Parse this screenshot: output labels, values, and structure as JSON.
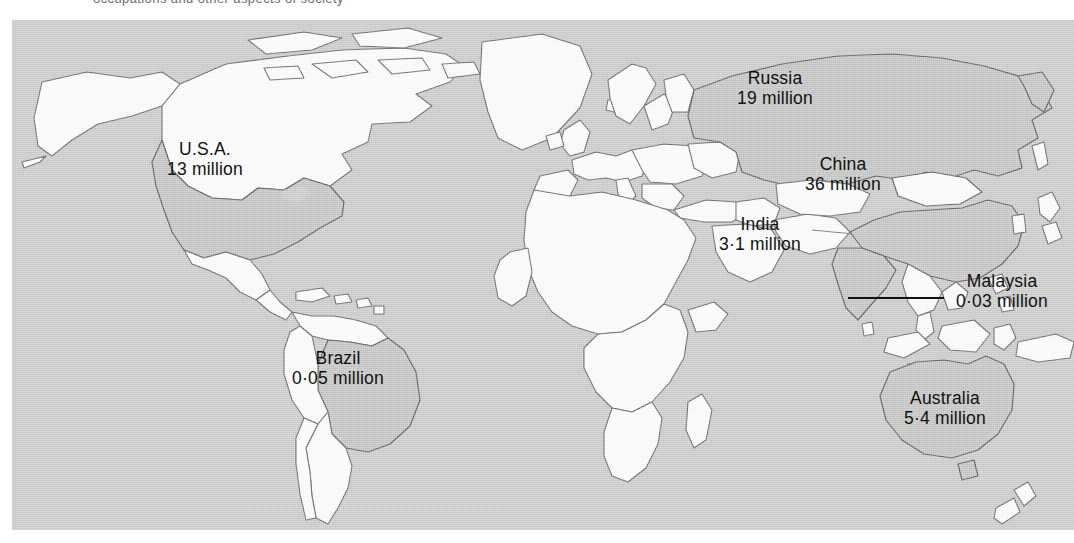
{
  "figure": {
    "type": "world-map-infographic",
    "caption_remnant": "occupations and other aspects of society",
    "ocean_color": "#cfcfcf",
    "land_unlabeled_color": "#ffffff",
    "land_highlight_color": "#c8c8c8",
    "border_color": "#6b6b6b",
    "label_color": "#111111",
    "frame": {
      "x": 12,
      "y": 20,
      "width": 1062,
      "height": 510
    }
  },
  "map_data": {
    "type": "choropleth-labels",
    "unit": "million",
    "countries": [
      {
        "name": "U.S.A.",
        "value": "13 million",
        "number": 13,
        "x": 205,
        "y": 149,
        "highlighted": true
      },
      {
        "name": "Brazil",
        "value": "0·05 million",
        "number": 0.05,
        "x": 338,
        "y": 358,
        "highlighted": true
      },
      {
        "name": "Russia",
        "value": "19 million",
        "number": 19,
        "x": 775,
        "y": 78,
        "highlighted": true
      },
      {
        "name": "China",
        "value": "36 million",
        "number": 36,
        "x": 843,
        "y": 164,
        "highlighted": true
      },
      {
        "name": "India",
        "value": "3·1 million",
        "number": 3.1,
        "x": 760,
        "y": 224,
        "highlighted": true
      },
      {
        "name": "Malaysia",
        "value": "0·03 million",
        "number": 0.03,
        "x": 1002,
        "y": 281,
        "highlighted": true,
        "leader": true
      },
      {
        "name": "Australia",
        "value": "5·4 million",
        "number": 5.4,
        "x": 945,
        "y": 398,
        "highlighted": true
      }
    ],
    "leader_line": {
      "x1": 848,
      "y1": 298,
      "x2": 944,
      "y2": 298
    }
  }
}
